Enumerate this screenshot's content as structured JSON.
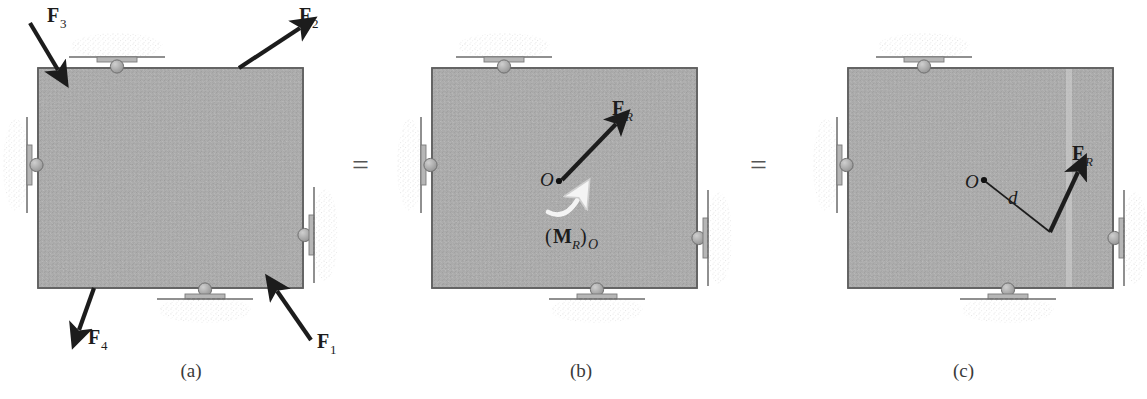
{
  "figure": {
    "type": "free-body-diagram",
    "panels": [
      {
        "id": "a",
        "caption": "(a)",
        "forces": [
          {
            "label": "F",
            "subscript": "1",
            "name": "force-f1",
            "position": "bottom-right",
            "direction": "up-left"
          },
          {
            "label": "F",
            "subscript": "2",
            "name": "force-f2",
            "position": "top-right",
            "direction": "up-right"
          },
          {
            "label": "F",
            "subscript": "3",
            "name": "force-f3",
            "position": "top-left",
            "direction": "down-right"
          },
          {
            "label": "F",
            "subscript": "4",
            "name": "force-f4",
            "position": "bottom-left",
            "direction": "down-left"
          }
        ]
      },
      {
        "id": "b",
        "caption": "(b)",
        "point_label": "O",
        "resultant": {
          "label": "F",
          "subscript": "R"
        },
        "moment": {
          "open_paren": "(",
          "label": "M",
          "subscript": "R",
          "close_paren": ")",
          "point": "O"
        }
      },
      {
        "id": "c",
        "caption": "(c)",
        "point_label": "O",
        "distance_label": "d",
        "resultant": {
          "label": "F",
          "subscript": "R"
        }
      }
    ],
    "equals": [
      {
        "symbol": "=",
        "name": "equals-sign-1"
      },
      {
        "symbol": "=",
        "name": "equals-sign-2"
      }
    ],
    "supports": [
      "roller-top",
      "roller-bottom",
      "roller-left",
      "roller-right"
    ],
    "colors": {
      "block_fill": "#a8a8a8",
      "block_edge": "#5f5f5f",
      "arrow": "#1c1c1c",
      "moment_arrow": "#f2f2f2",
      "ground": "#6b6b6b",
      "hatch": "#bdbdbd",
      "background": "#ffffff"
    }
  }
}
